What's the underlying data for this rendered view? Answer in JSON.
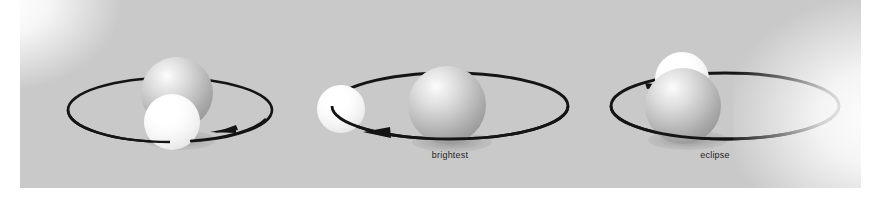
{
  "figure": {
    "type": "astronomy-diagram",
    "background_color": "#ffffff",
    "plate_color": "#c9c9c9",
    "stroke_color": "#141414"
  },
  "panels": [
    {
      "id": "panel-left",
      "caption": "",
      "orbit": {
        "direction": "counterclockwise-viewed-from-above",
        "arrow_position": "bottom-right",
        "arrow_points": "left"
      },
      "bodies": [
        {
          "name": "primary-star",
          "role": "larger dimmer star",
          "shade": "gray",
          "depth": "behind"
        },
        {
          "name": "companion-star",
          "role": "smaller hotter star",
          "shade": "white",
          "depth": "front"
        }
      ]
    },
    {
      "id": "panel-middle",
      "caption": "brightest",
      "orbit": {
        "direction": "counterclockwise-viewed-from-above",
        "arrow_position": "bottom-left",
        "arrow_points": "left"
      },
      "bodies": [
        {
          "name": "primary-star",
          "role": "larger dimmer star",
          "shade": "gray",
          "depth": "front"
        },
        {
          "name": "companion-star",
          "role": "smaller hotter star",
          "shade": "white",
          "depth": "side"
        }
      ]
    },
    {
      "id": "panel-right",
      "caption": "eclipse",
      "orbit": {
        "direction": "counterclockwise-viewed-from-above",
        "arrow_position": "top-left",
        "arrow_points": "right"
      },
      "bodies": [
        {
          "name": "primary-star",
          "role": "larger dimmer star",
          "shade": "gray",
          "depth": "front"
        },
        {
          "name": "companion-star",
          "role": "smaller hotter star",
          "shade": "white",
          "depth": "behind"
        }
      ]
    }
  ]
}
